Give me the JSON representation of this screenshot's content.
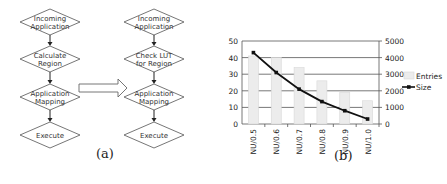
{
  "flowchart_left": {
    "steps": [
      "Incoming Application",
      "Calculate Region",
      "Application Mapping",
      "Execute"
    ],
    "lines": [
      [
        "Incoming",
        "Application"
      ],
      [
        "Calculate",
        "Region"
      ],
      [
        "Application",
        "Mapping"
      ],
      [
        "Execute"
      ]
    ]
  },
  "flowchart_right": {
    "steps": [
      "Incoming Application",
      "Check LUT for Region",
      "Application Mapping",
      "Execute"
    ],
    "lines": [
      [
        "Incoming",
        "Application"
      ],
      [
        "Check LUT",
        "for Region"
      ],
      [
        "Application",
        "Mapping"
      ],
      [
        "Execute"
      ]
    ]
  },
  "captions": {
    "a": "(a)",
    "b": "(b)"
  },
  "chart_data": {
    "type": "bar",
    "combo": "bar + line (dual axis)",
    "title": "",
    "xlabel": "",
    "ylabel": "",
    "categories": [
      "NU/0.5",
      "NU/0.6",
      "NU/0.7",
      "NU/0.8",
      "NU/0.9",
      "NU/1.0"
    ],
    "series": [
      {
        "name": "Entries",
        "type": "bar",
        "axis": "left",
        "values": [
          41,
          40,
          34,
          26,
          19,
          14
        ]
      },
      {
        "name": "Size",
        "type": "line",
        "axis": "right",
        "values": [
          4300,
          3100,
          2100,
          1350,
          800,
          300
        ]
      }
    ],
    "left_axis": {
      "ylim": [
        0,
        50
      ],
      "ticks": [
        0,
        10,
        20,
        30,
        40,
        50
      ]
    },
    "right_axis": {
      "ylim": [
        0,
        5000
      ],
      "ticks": [
        0,
        1000,
        2000,
        3000,
        4000,
        5000
      ]
    },
    "grid": true,
    "legend": {
      "position": "right",
      "entries": [
        "Entries",
        "Size"
      ]
    },
    "colors": {
      "bar": "#ececec",
      "bar_border": "#d8d8d8",
      "line": "#111111",
      "grid": "#555555"
    }
  }
}
